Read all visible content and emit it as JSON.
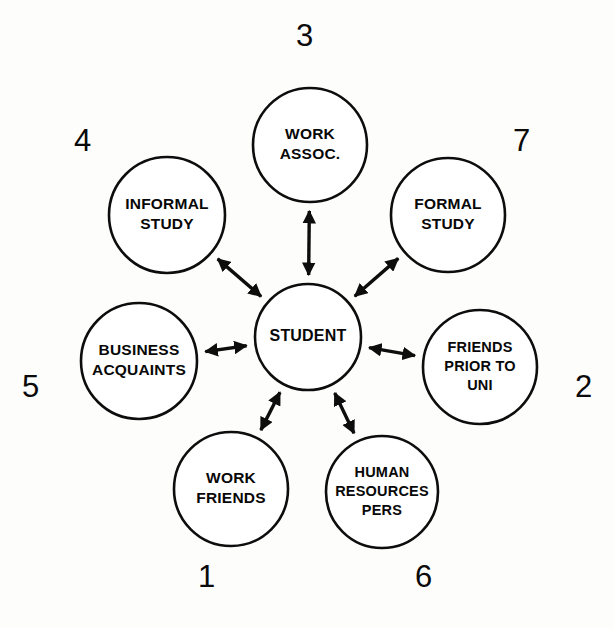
{
  "diagram": {
    "type": "hub-and-spoke network diagram",
    "hub": {
      "id": "student",
      "lines": [
        "STUDENT"
      ],
      "cx": 308,
      "cy": 337,
      "r": 53
    },
    "spokes": [
      {
        "id": "work-assoc",
        "lines": [
          "WORK",
          "ASSOC."
        ],
        "index": "3",
        "cx": 310,
        "cy": 145,
        "r": 57,
        "index_x": 296,
        "index_y": 20
      },
      {
        "id": "informal-study",
        "lines": [
          "INFORMAL",
          "STUDY"
        ],
        "index": "4",
        "cx": 167,
        "cy": 215,
        "r": 58,
        "index_x": 74,
        "index_y": 125
      },
      {
        "id": "formal-study",
        "lines": [
          "FORMAL",
          "STUDY"
        ],
        "index": "7",
        "cx": 448,
        "cy": 215,
        "r": 57,
        "index_x": 513,
        "index_y": 125
      },
      {
        "id": "business-acquaints",
        "lines": [
          "BUSINESS",
          "ACQUAINTS"
        ],
        "index": "5",
        "cx": 139,
        "cy": 361,
        "r": 58,
        "index_x": 22,
        "index_y": 371
      },
      {
        "id": "friends-prior-to-uni",
        "lines": [
          "FRIENDS",
          "PRIOR TO",
          "UNI"
        ],
        "index": "2",
        "cx": 480,
        "cy": 367,
        "r": 57,
        "index_x": 575,
        "index_y": 371
      },
      {
        "id": "work-friends",
        "lines": [
          "WORK",
          "FRIENDS"
        ],
        "index": "1",
        "cx": 231,
        "cy": 489,
        "r": 57,
        "index_x": 198,
        "index_y": 561
      },
      {
        "id": "human-resources-pers",
        "lines": [
          "HUMAN",
          "RESOURCES",
          "PERS"
        ],
        "index": "6",
        "cx": 382,
        "cy": 492,
        "r": 56,
        "index_x": 415,
        "index_y": 561
      }
    ],
    "connections": [
      {
        "id": "student-work-assoc",
        "from": "student",
        "to": "work-assoc",
        "style": "double-arrow"
      },
      {
        "id": "student-informal-study",
        "from": "student",
        "to": "informal-study",
        "style": "double-arrow"
      },
      {
        "id": "student-formal-study",
        "from": "student",
        "to": "formal-study",
        "style": "double-arrow"
      },
      {
        "id": "student-business-acquaints",
        "from": "student",
        "to": "business-acquaints",
        "style": "double-arrow"
      },
      {
        "id": "student-friends-prior-to-uni",
        "from": "student",
        "to": "friends-prior-to-uni",
        "style": "double-arrow"
      },
      {
        "id": "student-work-friends",
        "from": "student",
        "to": "work-friends",
        "style": "double-arrow"
      },
      {
        "id": "student-human-resources-pers",
        "from": "student",
        "to": "human-resources-pers",
        "style": "double-arrow"
      }
    ],
    "colors": {
      "background": "#fdfdfb",
      "stroke": "#0d0d0d",
      "node_fill": "#ffffff",
      "text": "#080808"
    }
  }
}
